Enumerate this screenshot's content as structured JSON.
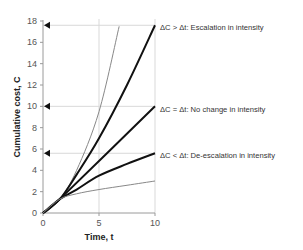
{
  "chart_data": {
    "type": "line",
    "title": "",
    "xlabel": "Time, t",
    "ylabel": "Cumulative cost, C",
    "xlim": [
      0,
      10
    ],
    "ylim": [
      0,
      18
    ],
    "x_ticks": [
      0,
      5,
      10
    ],
    "y_ticks": [
      0,
      2,
      4,
      6,
      8,
      10,
      12,
      14,
      16,
      18
    ],
    "grid": {
      "vertical_at": [
        5,
        10
      ],
      "horizontal_at": [
        5.6,
        10,
        17.6
      ]
    },
    "y_axis_markers": [
      5.6,
      10,
      17.6
    ],
    "legend": "none",
    "series": [
      {
        "name": "Upper bound (gray)",
        "color": "#888888",
        "width": 1,
        "points": [
          [
            0,
            0
          ],
          [
            1.5,
            1.3
          ],
          [
            3,
            4
          ],
          [
            5,
            9.5
          ],
          [
            6.8,
            17.5
          ]
        ]
      },
      {
        "name": "Escalation in intensity",
        "color": "#111111",
        "width": 2,
        "points": [
          [
            0,
            0
          ],
          [
            1.5,
            1.3
          ],
          [
            3,
            3.6
          ],
          [
            5,
            7
          ],
          [
            7.5,
            12
          ],
          [
            10,
            17.6
          ]
        ]
      },
      {
        "name": "No change in intensity",
        "color": "#111111",
        "width": 2,
        "points": [
          [
            0,
            0
          ],
          [
            1.5,
            1.3
          ],
          [
            10,
            10
          ]
        ]
      },
      {
        "name": "De-escalation in intensity",
        "color": "#111111",
        "width": 2,
        "points": [
          [
            0,
            0
          ],
          [
            1.5,
            1.3
          ],
          [
            3,
            2.2
          ],
          [
            5,
            3.5
          ],
          [
            7.5,
            4.6
          ],
          [
            10,
            5.6
          ]
        ]
      },
      {
        "name": "Lower bound (gray)",
        "color": "#888888",
        "width": 1,
        "points": [
          [
            0,
            0
          ],
          [
            1.5,
            1.3
          ],
          [
            3,
            1.8
          ],
          [
            5,
            2.2
          ],
          [
            7.5,
            2.6
          ],
          [
            10,
            3
          ]
        ]
      }
    ],
    "annotations": [
      {
        "text": "ΔC > Δt: Escalation in intensity",
        "at": [
          10,
          17.6
        ]
      },
      {
        "text": "ΔC = Δt: No change in intensity",
        "at": [
          10,
          10
        ]
      },
      {
        "text": "ΔC < Δt: De-escalation in intensity",
        "at": [
          10,
          5.6
        ]
      }
    ]
  },
  "labels": {
    "xlabel": "Time, t",
    "ylabel": "Cumulative cost, C",
    "annot_escalation": "ΔC > Δt: Escalation in intensity",
    "annot_nochange": "ΔC = Δt: No change in intensity",
    "annot_deescalation": "ΔC < Δt: De-escalation in intensity"
  }
}
